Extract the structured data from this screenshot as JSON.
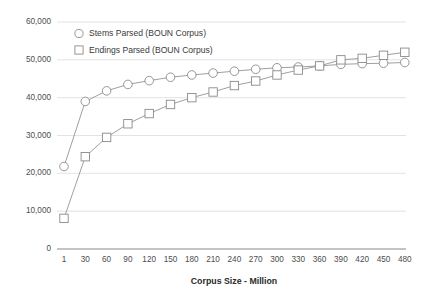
{
  "chart_data": {
    "type": "line",
    "title": "",
    "xlabel": "Corpus Size - Million",
    "ylabel": "",
    "grid": true,
    "legend_position": "top-left-inside",
    "x": [
      1,
      30,
      60,
      90,
      120,
      150,
      180,
      210,
      240,
      270,
      300,
      330,
      360,
      390,
      420,
      450,
      480
    ],
    "categories": [
      "1",
      "30",
      "60",
      "90",
      "120",
      "150",
      "180",
      "210",
      "240",
      "270",
      "300",
      "330",
      "360",
      "390",
      "420",
      "450",
      "480"
    ],
    "xtick_labels": [
      "1",
      "30",
      "60",
      "90",
      "120",
      "150",
      "180",
      "210",
      "240",
      "270",
      "300",
      "330",
      "360",
      "390",
      "420",
      "450",
      "480"
    ],
    "ytick_labels": [
      "0",
      "10,000",
      "20,000",
      "30,000",
      "40,000",
      "50,000",
      "60,000"
    ],
    "ytick_values": [
      0,
      10000,
      20000,
      30000,
      40000,
      50000,
      60000
    ],
    "ylim": [
      0,
      60000
    ],
    "series": [
      {
        "name": "Stems Parsed (BOUN Corpus)",
        "marker": "circle",
        "values": [
          21800,
          39000,
          41800,
          43500,
          44500,
          45400,
          46000,
          46500,
          47000,
          47500,
          47900,
          48100,
          48400,
          48800,
          49000,
          49100,
          49300
        ]
      },
      {
        "name": "Endings Parsed (BOUN Corpus)",
        "marker": "square",
        "values": [
          8100,
          24400,
          29500,
          33100,
          35800,
          38200,
          40000,
          41500,
          43200,
          44400,
          46000,
          47300,
          48400,
          50000,
          50400,
          51200,
          52000
        ]
      }
    ],
    "colors": {
      "line": "#8e8e8e",
      "marker_fill": "#ffffff",
      "marker_stroke": "#8a8a8a",
      "grid": "#d7d7d7",
      "axis": "#8a8a8a",
      "text": "#4d4d4d"
    }
  },
  "legend": {
    "entries": [
      {
        "label": "Stems Parsed (BOUN Corpus)",
        "marker": "circle-marker-icon"
      },
      {
        "label": "Endings Parsed (BOUN Corpus)",
        "marker": "square-marker-icon"
      }
    ]
  }
}
